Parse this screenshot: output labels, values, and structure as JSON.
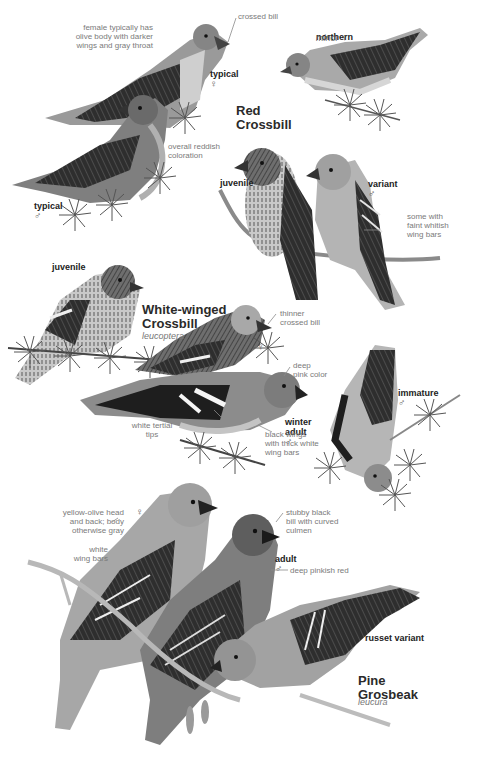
{
  "page": {
    "type": "field guide plate",
    "palette": {
      "background": "#ffffff",
      "label_text": "#7a7a7a",
      "tag_text": "#222222",
      "title_text": "#2a2a2a"
    }
  },
  "species": [
    {
      "name": "Red\nCrossbill",
      "figures": [
        {
          "tag": "typical",
          "sex": "♀"
        },
        {
          "tag": "typical",
          "sex": "♂"
        },
        {
          "tag": "northern",
          "subtitle": "minor",
          "sex": "♀"
        },
        {
          "tag": "juvenile"
        },
        {
          "tag": "variant",
          "sex": "♂"
        }
      ],
      "annotations": [
        "female typically has\nolive body with darker\nwings and gray throat",
        "crossed bill",
        "overall reddish\ncoloration",
        "some with\nfaint whitish\nwing bars"
      ]
    },
    {
      "name": "White-winged\nCrossbill",
      "scientific": "leucoptera",
      "figures": [
        {
          "tag": "juvenile"
        },
        {
          "tag": "",
          "sex": "♀"
        },
        {
          "tag": "winter\nadult",
          "sex": "♂"
        },
        {
          "tag": "immature",
          "sex": "♂"
        }
      ],
      "annotations": [
        "thinner\ncrossed bill",
        "deep\npink color",
        "white tertial\ntips",
        "black wings\nwith thick white\nwing bars"
      ]
    },
    {
      "name": "Pine\nGrosbeak",
      "scientific": "leucura",
      "figures": [
        {
          "tag": "",
          "sex": "♀"
        },
        {
          "tag": "adult",
          "sex": "♂"
        },
        {
          "tag": "russet variant"
        }
      ],
      "annotations": [
        "yellow-olive head\nand back; body\notherwise gray",
        "white\nwing bars",
        "stubby black\nbill with curved\nculmen",
        "deep pinkish red"
      ]
    }
  ]
}
